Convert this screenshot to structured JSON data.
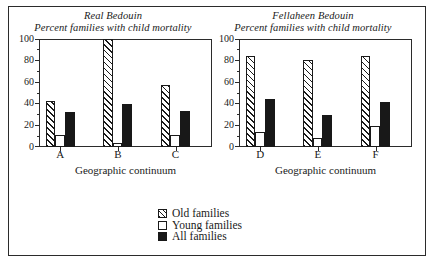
{
  "figure": {
    "frame": true,
    "background": "#ffffff",
    "ink_color": "#1a1a1a"
  },
  "legend": {
    "position": "bottom-center",
    "entries": [
      {
        "label": "Old families",
        "style": "hatched",
        "swatch_name": "swatch-old-families"
      },
      {
        "label": "Young families",
        "style": "white",
        "swatch_name": "swatch-young-families"
      },
      {
        "label": "All families",
        "style": "black",
        "swatch_name": "swatch-all-families"
      }
    ]
  },
  "panels": [
    {
      "id": "real-bedouin",
      "title_line1": "Real Bedouin",
      "title_line2": "Percent families with child mortality",
      "xlabel": "Geographic continuum",
      "ylabel": "",
      "ylim": [
        0,
        100
      ],
      "yticks": [
        0,
        20,
        40,
        60,
        80,
        100
      ],
      "ytick_labels": [
        "0",
        "20",
        "40",
        "60",
        "80",
        "100"
      ],
      "yminor": [
        10,
        30,
        50,
        70,
        90
      ],
      "categories": [
        "A",
        "B",
        "C"
      ]
    },
    {
      "id": "fellaheen-bedouin",
      "title_line1": "Fellaheen Bedouin",
      "title_line2": "Percent families with child mortality",
      "xlabel": "Geographic continuum",
      "ylabel": "",
      "ylim": [
        0,
        100
      ],
      "yticks": [
        0,
        20,
        40,
        60,
        80,
        100
      ],
      "ytick_labels": [
        "0",
        "20",
        "40",
        "60",
        "80",
        "100"
      ],
      "yminor": [
        10,
        30,
        50,
        70,
        90
      ],
      "categories": [
        "D",
        "E",
        "F"
      ]
    }
  ],
  "chart_data": [
    {
      "type": "bar",
      "title": "Real Bedouin — Percent families with child mortality",
      "xlabel": "Geographic continuum",
      "ylabel": "Percent families with child mortality",
      "ylim": [
        0,
        100
      ],
      "grid": false,
      "legend_position": "bottom-center",
      "categories": [
        "A",
        "B",
        "C"
      ],
      "series": [
        {
          "name": "Old families",
          "values": [
            42,
            100,
            57
          ]
        },
        {
          "name": "Young families",
          "values": [
            11,
            3,
            11
          ]
        },
        {
          "name": "All families",
          "values": [
            32,
            39,
            33
          ]
        }
      ]
    },
    {
      "type": "bar",
      "title": "Fellaheen Bedouin — Percent families with child mortality",
      "xlabel": "Geographic continuum",
      "ylabel": "Percent families with child mortality",
      "ylim": [
        0,
        100
      ],
      "grid": false,
      "legend_position": "bottom-center",
      "categories": [
        "D",
        "E",
        "F"
      ],
      "series": [
        {
          "name": "Old families",
          "values": [
            84,
            80,
            84
          ]
        },
        {
          "name": "Young families",
          "values": [
            13,
            8,
            19
          ]
        },
        {
          "name": "All families",
          "values": [
            44,
            29,
            41
          ]
        }
      ]
    }
  ]
}
